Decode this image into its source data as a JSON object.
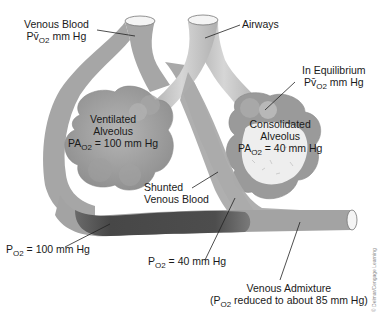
{
  "diagram": {
    "labels": {
      "venous_blood_line1": "Venous Blood",
      "venous_blood_line2_prefix": "Pv̄",
      "venous_blood_line2_sub": "O2",
      "venous_blood_line2_suffix": " mm Hg",
      "airways": "Airways",
      "equilibrium_line1": "In Equilibrium",
      "equilibrium_line2_prefix": "Pv̄",
      "equilibrium_line2_sub": "O2",
      "equilibrium_line2_suffix": " mm Hg",
      "ventilated_line1": "Ventilated",
      "ventilated_line2": "Alveolus",
      "ventilated_line3_prefix": "PA",
      "ventilated_line3_sub": "O2",
      "ventilated_line3_suffix": " = 100 mm Hg",
      "consolidated_line1": "Consolidated",
      "consolidated_line2": "Alveolus",
      "consolidated_line3_prefix": "PA",
      "consolidated_line3_sub": "O2",
      "consolidated_line3_suffix": " = 40 mm Hg",
      "shunted_line1": "Shunted",
      "shunted_line2": "Venous Blood",
      "po2_100_prefix": "P",
      "po2_100_sub": "O2",
      "po2_100_suffix": " = 100 mm Hg",
      "po2_40_prefix": "P",
      "po2_40_sub": "O2",
      "po2_40_suffix": " = 40 mm Hg",
      "admixture_line1": "Venous Admixture",
      "admixture_line2_prefix": "(P",
      "admixture_line2_sub": "O2",
      "admixture_line2_suffix": " reduced to about 85 mm Hg)"
    },
    "credit": "© Delmar/Cengage Learning",
    "colors": {
      "vessel": "#a8a8a8",
      "vessel_dark": "#4a4a4a",
      "airway": "#c4c4c4",
      "alveolus": "#9a9a9a",
      "alveolus_light": "#b8b8b8",
      "consolidated_fill": "#ececec"
    }
  }
}
